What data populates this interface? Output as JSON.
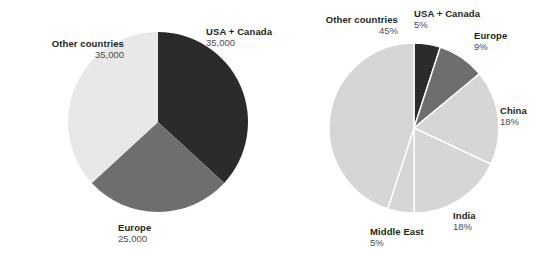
{
  "colors": {
    "dark": "#2b2b2b",
    "medium": "#6e6e6e",
    "light": "#e8e8e8",
    "light_right": "#d6d6d6",
    "background": "#ffffff",
    "label_name": "#231f20",
    "label_value": "#4d4d4d"
  },
  "chart_data": [
    {
      "type": "pie",
      "title": "",
      "id": "left-pie",
      "value_format": "absolute",
      "total": 95000,
      "start_angle_deg": 0,
      "direction": "clockwise",
      "legend_position": "callout",
      "categories": [
        "USA + Canada",
        "Europe",
        "Other countries"
      ],
      "values": [
        35000,
        25000,
        35000
      ],
      "labels": [
        "35,000",
        "25,000",
        "35,000"
      ],
      "slice_colors": [
        "#2b2b2b",
        "#6e6e6e",
        "#e8e8e8"
      ],
      "center": {
        "x": 158,
        "y": 122,
        "r": 90
      }
    },
    {
      "type": "pie",
      "title": "",
      "id": "right-pie",
      "value_format": "percent",
      "total": 100,
      "start_angle_deg": 0,
      "direction": "clockwise",
      "legend_position": "callout",
      "categories": [
        "USA + Canada",
        "Europe",
        "China",
        "India",
        "Middle East",
        "Other countries"
      ],
      "values": [
        5,
        9,
        18,
        18,
        5,
        45
      ],
      "labels": [
        "5%",
        "9%",
        "18%",
        "18%",
        "5%",
        "45%"
      ],
      "slice_colors": [
        "#2b2b2b",
        "#6e6e6e",
        "#d6d6d6",
        "#d6d6d6",
        "#d6d6d6",
        "#d6d6d6"
      ],
      "center": {
        "x": 414,
        "y": 128,
        "r": 85
      }
    }
  ],
  "left_chart": {
    "labels": {
      "other_countries": {
        "name": "Other countries",
        "value": "35,000"
      },
      "usa_canada": {
        "name": "USA + Canada",
        "value": "35,000"
      },
      "europe": {
        "name": "Europe",
        "value": "25,000"
      }
    }
  },
  "right_chart": {
    "labels": {
      "other_countries": {
        "name": "Other countries",
        "value": "45%"
      },
      "usa_canada": {
        "name": "USA + Canada",
        "value": "5%"
      },
      "europe": {
        "name": "Europe",
        "value": "9%"
      },
      "china": {
        "name": "China",
        "value": "18%"
      },
      "india": {
        "name": "India",
        "value": "18%"
      },
      "middle_east": {
        "name": "Middle East",
        "value": "5%"
      }
    }
  }
}
